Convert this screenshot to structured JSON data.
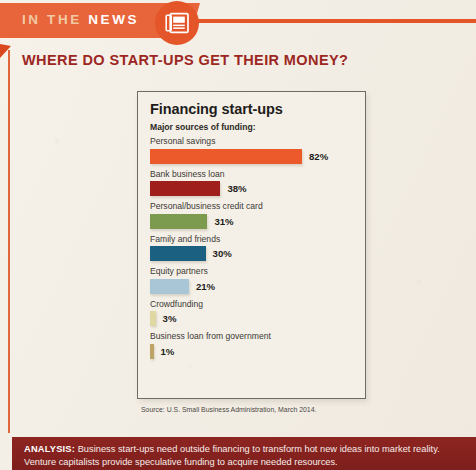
{
  "banner": {
    "label_light": "IN THE",
    "label_bold": "NEWS",
    "icon": "newspaper-icon",
    "color": "#e4552a"
  },
  "headline": {
    "text": "WHERE DO START-UPS GET THEIR MONEY?",
    "color": "#9c2722"
  },
  "chart_data": {
    "type": "bar",
    "title": "Financing start-ups",
    "subtitle": "Major sources of funding:",
    "orientation": "horizontal",
    "xlabel": "",
    "ylabel": "",
    "xlim": [
      0,
      100
    ],
    "grid": false,
    "legend": "none",
    "unit": "%",
    "categories": [
      "Personal savings",
      "Bank business loan",
      "Personal/business credit card",
      "Family and friends",
      "Equity partners",
      "Crowdfunding",
      "Business loan from government"
    ],
    "values": [
      82,
      38,
      31,
      30,
      21,
      3,
      1
    ],
    "value_labels": [
      "82%",
      "38%",
      "31%",
      "30%",
      "21%",
      "3%",
      "1%"
    ],
    "colors": [
      "#ec5a2c",
      "#9e1f1c",
      "#7d9b4e",
      "#1b6080",
      "#a8c6d6",
      "#e0d8a2",
      "#bca467"
    ],
    "source": "Source: U.S. Small Business Administration, March 2014."
  },
  "analysis": {
    "label": "ANALYSIS:",
    "text": " Business start-ups need outside financing to transform hot new ideas into market reality. Venture capitalists provide speculative funding to acquire needed resources.",
    "color": "#8d2521"
  }
}
